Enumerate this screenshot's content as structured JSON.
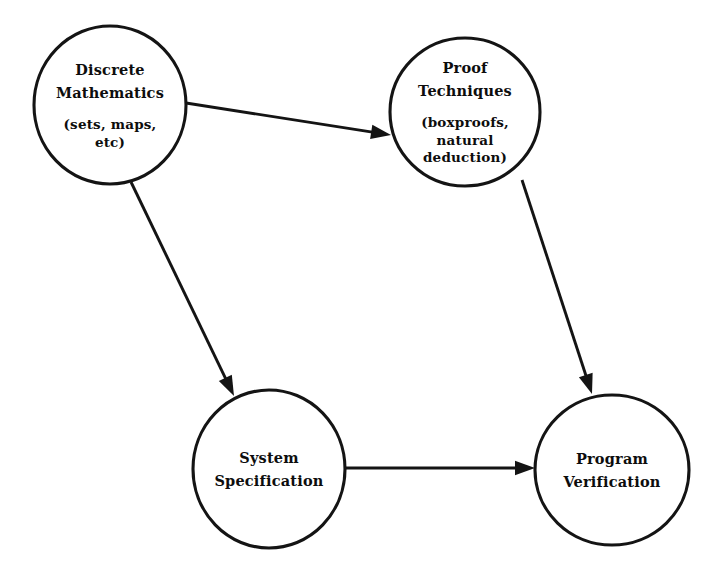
{
  "diagram": {
    "background_color": "#ffffff",
    "stroke_color": "#141414",
    "text_color": "#0d0d0d",
    "nodes": [
      {
        "id": "discrete-mathematics",
        "shape": "ellipse",
        "cx": 110,
        "cy": 105,
        "rx": 76,
        "ry": 79,
        "title_lines": [
          "Discrete",
          "Mathematics"
        ],
        "sub_lines": [
          "(sets, maps,",
          "etc)"
        ]
      },
      {
        "id": "proof-techniques",
        "shape": "ellipse",
        "cx": 465,
        "cy": 112,
        "rx": 75,
        "ry": 74,
        "title_lines": [
          "Proof",
          "Techniques"
        ],
        "sub_lines": [
          "(boxproofs,",
          "natural",
          "deduction)"
        ]
      },
      {
        "id": "system-specification",
        "shape": "ellipse",
        "cx": 269,
        "cy": 469,
        "rx": 76,
        "ry": 79,
        "title_lines": [
          "System",
          "Specification"
        ],
        "sub_lines": []
      },
      {
        "id": "program-verification",
        "shape": "ellipse",
        "cx": 612,
        "cy": 470,
        "rx": 77,
        "ry": 75,
        "title_lines": [
          "Program",
          "Verification"
        ],
        "sub_lines": []
      }
    ],
    "edges": [
      {
        "id": "discrete-mathematics-to-proof-techniques",
        "from": "discrete-mathematics",
        "to": "proof-techniques",
        "x1": 186,
        "y1": 103,
        "x2": 391,
        "y2": 135,
        "arrowhead": "end"
      },
      {
        "id": "discrete-mathematics-to-system-specification",
        "from": "discrete-mathematics",
        "to": "system-specification",
        "x1": 131,
        "y1": 182,
        "x2": 234,
        "y2": 396,
        "arrowhead": "end"
      },
      {
        "id": "proof-techniques-to-program-verification",
        "from": "proof-techniques",
        "to": "program-verification",
        "x1": 522,
        "y1": 180,
        "x2": 592,
        "y2": 394,
        "arrowhead": "end"
      },
      {
        "id": "system-specification-to-program-verification",
        "from": "system-specification",
        "to": "program-verification",
        "x1": 346,
        "y1": 468,
        "x2": 535,
        "y2": 468,
        "arrowhead": "end"
      }
    ]
  }
}
